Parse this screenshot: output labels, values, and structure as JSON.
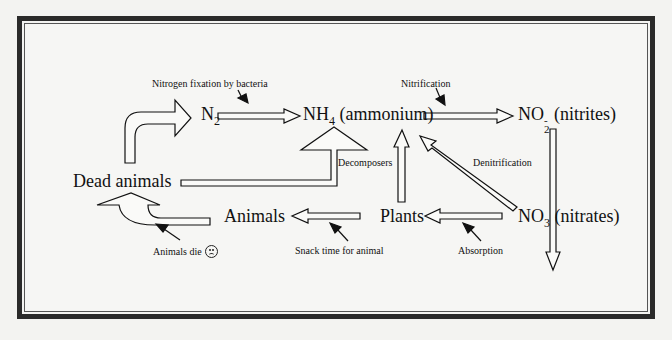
{
  "diagram": {
    "nodes": {
      "n2": {
        "base": "N",
        "sub": "2"
      },
      "nh4": {
        "base": "NH",
        "sub": "4",
        "suffix": " (ammonium)"
      },
      "no2": {
        "base": "NO",
        "sup": "-",
        "sub": "2",
        "suffix": " (nitrites)"
      },
      "no3": {
        "base": "NO",
        "sub": "3",
        "suffix": " (nitrates)"
      },
      "plants": "Plants",
      "animals": "Animals",
      "dead_animals": "Dead animals"
    },
    "labels": {
      "fixation": "Nitrogen fixation by bacteria",
      "nitrification": "Nitrification",
      "decomposers": "Decomposers",
      "denitrification": "Denitrification",
      "absorption": "Absorption",
      "snack": "Snack time for animal",
      "animals_die": "Animals die"
    },
    "edges": [
      {
        "from": "Dead animals",
        "to": "N2",
        "label": ""
      },
      {
        "from": "N2",
        "to": "NH4 (ammonium)",
        "label": "Nitrogen fixation by bacteria"
      },
      {
        "from": "NH4 (ammonium)",
        "to": "NO2- (nitrites)",
        "label": "Nitrification"
      },
      {
        "from": "NO2- (nitrites)",
        "to": "NO3 (nitrates)",
        "label": ""
      },
      {
        "from": "NO3 (nitrates)",
        "to": "NH4 (ammonium)",
        "label": "Denitrification"
      },
      {
        "from": "NO3 (nitrates)",
        "to": "Plants",
        "label": "Absorption"
      },
      {
        "from": "Plants",
        "to": "NH4 (ammonium)",
        "label": ""
      },
      {
        "from": "Plants",
        "to": "Animals",
        "label": "Snack time for animal"
      },
      {
        "from": "Animals",
        "to": "Dead animals",
        "label": "Animals die"
      },
      {
        "from": "Dead animals",
        "to": "NH4 (ammonium)",
        "label": "Decomposers"
      }
    ],
    "colors": {
      "frame": "#2a2a2a",
      "background": "#f6f6f4",
      "ink": "#111111"
    }
  }
}
